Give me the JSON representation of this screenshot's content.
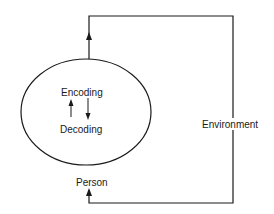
{
  "diagram": {
    "ellipse_labels": {
      "encoding": "Encoding",
      "decoding": "Decoding"
    },
    "person_label": "Person",
    "environment_label": "Environment",
    "colors": {
      "line": "#1a1a1a",
      "background": "#ffffff"
    }
  }
}
